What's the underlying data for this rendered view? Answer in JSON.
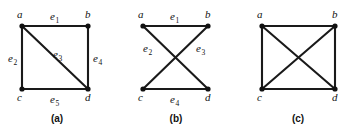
{
  "figure": {
    "background_color": "#ffffff",
    "ink_color": "#111111",
    "panels": [
      {
        "caption": "(a)",
        "caption_pos": {
          "x": 57,
          "y": 122
        },
        "vertices": [
          {
            "id": "a",
            "label": "a",
            "x": 22,
            "y": 26,
            "label_x": 17,
            "label_y": 18
          },
          {
            "id": "b",
            "label": "b",
            "x": 88,
            "y": 26,
            "label_x": 85,
            "label_y": 18
          },
          {
            "id": "c",
            "label": "c",
            "x": 22,
            "y": 89,
            "label_x": 17,
            "label_y": 101
          },
          {
            "id": "d",
            "label": "d",
            "x": 88,
            "y": 89,
            "label_x": 85,
            "label_y": 101
          }
        ],
        "edges": [
          {
            "id": "e1",
            "label": "e",
            "sub": "1",
            "from": "a",
            "to": "b",
            "label_x": 50,
            "label_y": 20
          },
          {
            "id": "e2",
            "label": "e",
            "sub": "2",
            "from": "a",
            "to": "c",
            "label_x": 8,
            "label_y": 62
          },
          {
            "id": "e3",
            "label": "e",
            "sub": "3",
            "from": "a",
            "to": "d",
            "label_x": 53,
            "label_y": 58
          },
          {
            "id": "e4",
            "label": "e",
            "sub": "4",
            "from": "b",
            "to": "d",
            "label_x": 93,
            "label_y": 62
          },
          {
            "id": "e5",
            "label": "e",
            "sub": "5",
            "from": "c",
            "to": "d",
            "label_x": 50,
            "label_y": 103
          }
        ]
      },
      {
        "caption": "(b)",
        "caption_pos": {
          "x": 176,
          "y": 122
        },
        "vertices": [
          {
            "id": "a",
            "label": "a",
            "x": 143,
            "y": 26,
            "label_x": 138,
            "label_y": 18
          },
          {
            "id": "b",
            "label": "b",
            "x": 208,
            "y": 26,
            "label_x": 205,
            "label_y": 18
          },
          {
            "id": "c",
            "label": "c",
            "x": 143,
            "y": 89,
            "label_x": 138,
            "label_y": 101
          },
          {
            "id": "d",
            "label": "d",
            "x": 208,
            "y": 89,
            "label_x": 205,
            "label_y": 101
          }
        ],
        "edges": [
          {
            "id": "e1",
            "label": "e",
            "sub": "1",
            "from": "a",
            "to": "b",
            "label_x": 170,
            "label_y": 20
          },
          {
            "id": "e2",
            "label": "e",
            "sub": "2",
            "from": "a",
            "to": "d",
            "label_x": 143,
            "label_y": 52
          },
          {
            "id": "e3",
            "label": "e",
            "sub": "3",
            "from": "b",
            "to": "c",
            "label_x": 196,
            "label_y": 52
          },
          {
            "id": "e4",
            "label": "e",
            "sub": "4",
            "from": "c",
            "to": "d",
            "label_x": 170,
            "label_y": 103
          }
        ]
      },
      {
        "caption": "(c)",
        "caption_pos": {
          "x": 298,
          "y": 122
        },
        "vertices": [
          {
            "id": "a",
            "label": "a",
            "x": 262,
            "y": 26,
            "label_x": 257,
            "label_y": 18
          },
          {
            "id": "b",
            "label": "b",
            "x": 335,
            "y": 26,
            "label_x": 332,
            "label_y": 18
          },
          {
            "id": "c",
            "label": "c",
            "x": 262,
            "y": 89,
            "label_x": 257,
            "label_y": 101
          },
          {
            "id": "d",
            "label": "d",
            "x": 335,
            "y": 89,
            "label_x": 332,
            "label_y": 101
          }
        ],
        "edges": [
          {
            "id": "ab",
            "label": "",
            "sub": "",
            "from": "a",
            "to": "b"
          },
          {
            "id": "ac",
            "label": "",
            "sub": "",
            "from": "a",
            "to": "c"
          },
          {
            "id": "ad",
            "label": "",
            "sub": "",
            "from": "a",
            "to": "d"
          },
          {
            "id": "bc",
            "label": "",
            "sub": "",
            "from": "b",
            "to": "c"
          },
          {
            "id": "bd",
            "label": "",
            "sub": "",
            "from": "b",
            "to": "d"
          },
          {
            "id": "cd",
            "label": "",
            "sub": "",
            "from": "c",
            "to": "d"
          }
        ]
      }
    ]
  }
}
